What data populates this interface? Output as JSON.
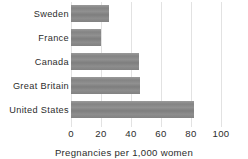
{
  "chart_data": {
    "type": "bar",
    "orientation": "horizontal",
    "title": "",
    "xlabel": "Pregnancies per 1,000 women",
    "ylabel": "",
    "xlim": [
      0,
      100
    ],
    "xticks": [
      "0",
      "20",
      "40",
      "60",
      "80",
      "100"
    ],
    "grid": true,
    "legend": "none",
    "categories": [
      "Sweden",
      "France",
      "Canada",
      "Great Britain",
      "United States"
    ],
    "values": [
      25,
      20,
      45,
      46,
      82
    ],
    "bar_color": "#8d8d8d",
    "gridline_color": "#e2e2e2",
    "text_color": "#2c2c2c"
  }
}
